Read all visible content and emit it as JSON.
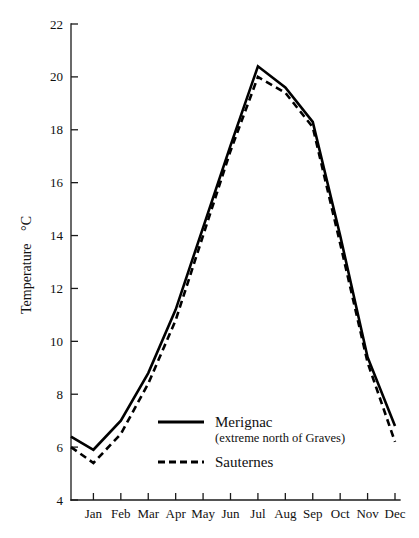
{
  "chart_data": {
    "type": "line",
    "title": "",
    "xlabel": "",
    "ylabel": "Temperature  °C",
    "ylabel_text": "Temperature",
    "ylabel_unit": "°C",
    "categories": [
      "Jan",
      "Feb",
      "Mar",
      "Apr",
      "May",
      "Jun",
      "Jul",
      "Aug",
      "Sep",
      "Oct",
      "Nov",
      "Dec"
    ],
    "ylim": [
      4,
      22
    ],
    "yticks": [
      4,
      6,
      8,
      10,
      12,
      14,
      16,
      18,
      20,
      22
    ],
    "ytick_labels": [
      "4",
      "6",
      "8",
      "10",
      "12",
      "14",
      "16",
      "18",
      "20",
      "22"
    ],
    "grid": false,
    "legend_position": "inside-lower-center",
    "series": [
      {
        "name": "Merignac",
        "subtitle": "(extreme north of Graves)",
        "style": "solid",
        "color": "#000000",
        "start_edge_value": 6.4,
        "values": [
          5.9,
          7.0,
          8.8,
          11.2,
          14.3,
          17.4,
          20.4,
          19.6,
          18.3,
          14.0,
          9.4,
          6.8
        ]
      },
      {
        "name": "Sauternes",
        "subtitle": "",
        "style": "dashed",
        "color": "#000000",
        "start_edge_value": 6.0,
        "values": [
          5.4,
          6.5,
          8.4,
          10.8,
          14.0,
          17.2,
          20.0,
          19.4,
          18.1,
          13.7,
          9.2,
          6.2
        ]
      }
    ]
  },
  "legend": {
    "entries": [
      {
        "label": "Merignac",
        "sublabel": "(extreme north of Graves)",
        "style": "solid"
      },
      {
        "label": "Sauternes",
        "sublabel": "",
        "style": "dashed"
      }
    ]
  }
}
